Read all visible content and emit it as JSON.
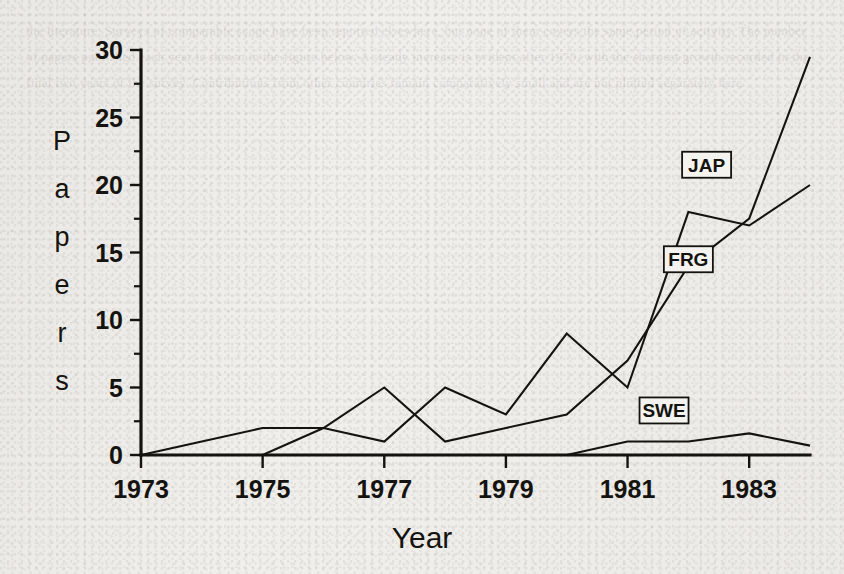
{
  "figure": {
    "background_color": "#f0efec",
    "ink_color": "#15130f",
    "ghost_text": "the literature. Surveys of comparable scope have been reported elsewhere, but none of them covers the same period of activity. The number of papers published each year is shown in the figure below. A steady increase is evident after 1979, with the sharpest growth recorded in the final two years of the survey. Contributions from other countries remain comparatively small and are not plotted separately here."
  },
  "chart_data": {
    "type": "line",
    "title": "",
    "xlabel": "Year",
    "ylabel": "Papers",
    "xlim": [
      1973,
      1984
    ],
    "ylim": [
      0,
      30
    ],
    "xticks": [
      1973,
      1975,
      1977,
      1979,
      1981,
      1983
    ],
    "xtick_labels": [
      "1973",
      "1975",
      "1977",
      "1979",
      "1981",
      "1983"
    ],
    "xticks_minor": [
      1974,
      1976,
      1978,
      1980,
      1982,
      1984
    ],
    "yticks": [
      0,
      5,
      10,
      15,
      20,
      25,
      30
    ],
    "ytick_labels": [
      "0",
      "5",
      "10",
      "15",
      "20",
      "25",
      "30"
    ],
    "yticks_minor": [
      2.5,
      7.5,
      12.5,
      17.5,
      22.5,
      27.5
    ],
    "grid": false,
    "legend": "inline-boxed-labels",
    "x": [
      1973,
      1974,
      1975,
      1976,
      1977,
      1978,
      1979,
      1980,
      1981,
      1982,
      1983,
      1984
    ],
    "series": [
      {
        "name": "JAP",
        "label": "JAP",
        "label_x": 1982.3,
        "label_y": 21.5,
        "values": [
          0,
          0,
          0,
          2,
          5,
          1,
          2,
          3,
          7,
          14,
          17.5,
          29.5
        ]
      },
      {
        "name": "FRG",
        "label": "FRG",
        "label_x": 1982.0,
        "label_y": 14.5,
        "values": [
          0,
          1,
          2,
          2,
          1,
          5,
          3,
          9,
          5,
          18,
          17,
          20
        ]
      },
      {
        "name": "SWE",
        "label": "SWE",
        "label_x": 1981.6,
        "label_y": 3.3,
        "values": [
          0,
          0,
          0,
          0,
          0,
          0,
          0,
          0,
          1,
          1,
          1.6,
          0.7
        ]
      }
    ]
  }
}
